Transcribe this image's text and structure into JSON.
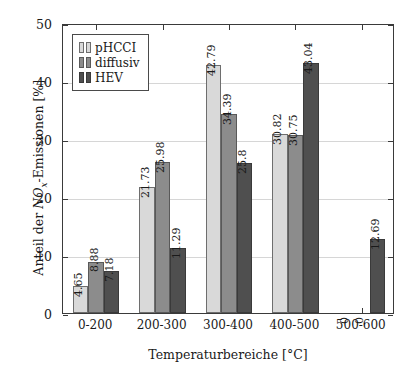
{
  "chart_data": {
    "type": "bar",
    "title": "",
    "subtitle": "",
    "xlabel": "Temperaturbereiche [°C]",
    "ylabel": "Anteil der NOx-Emissionen [%]",
    "ylabel_parts": {
      "prefix": "Anteil der ",
      "var": "NO",
      "sub": "x",
      "suffix": "-Emissionen [%]"
    },
    "xlabel_parts": {
      "text": "Temperaturbereiche [",
      "degree": "°C",
      "close": "]"
    },
    "categories": [
      "0-200",
      "200-300",
      "300-400",
      "400-500",
      "500-600"
    ],
    "ylim": [
      0,
      50
    ],
    "yticks": [
      0,
      10,
      20,
      30,
      40,
      50
    ],
    "ytick_labels": [
      "0",
      "10",
      "20",
      "30",
      "40",
      "50"
    ],
    "grid": "horizontal",
    "legend_position": "top-left",
    "series": [
      {
        "name": "pHCCI",
        "color": "#d9d9d9",
        "values": [
          4.65,
          21.73,
          42.79,
          30.82,
          0
        ],
        "labels": [
          "4.65",
          "21.73",
          "42.79",
          "30.82",
          "0"
        ]
      },
      {
        "name": "diffusiv",
        "color": "#8c8c8c",
        "values": [
          8.88,
          25.98,
          34.39,
          30.75,
          0
        ],
        "labels": [
          "8.88",
          "25.98",
          "34.39",
          "30.75",
          "0"
        ]
      },
      {
        "name": "HEV",
        "color": "#4f4f4f",
        "values": [
          7.18,
          11.29,
          25.8,
          43.04,
          12.69
        ],
        "labels": [
          "7.18",
          "11.29",
          "25.8",
          "43.04",
          "12.69"
        ]
      }
    ]
  },
  "colors": {
    "axis": "#3a3a3a",
    "grid": "#d6d6d6",
    "text": "#1a1a1a",
    "background": "#ffffff",
    "series_0": "#d9d9d9",
    "series_1": "#8c8c8c",
    "series_2": "#4f4f4f"
  }
}
